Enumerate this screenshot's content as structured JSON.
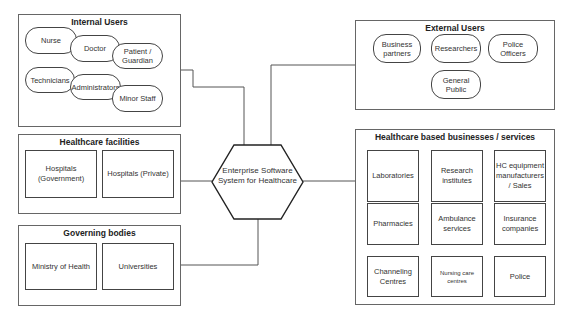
{
  "center": {
    "label_line1": "Enterprise Software",
    "label_line2": "System for Healthcare"
  },
  "internal_users": {
    "title": "Internal Users",
    "items": [
      "Nurse",
      "Doctor",
      "Patient / Guardian",
      "Technicians",
      "Administrators",
      "Minor Staff"
    ]
  },
  "healthcare_facilities": {
    "title": "Healthcare facilities",
    "items": [
      "Hospitals (Government)",
      "Hospitals (Private)"
    ]
  },
  "governing_bodies": {
    "title": "Governing bodies",
    "items": [
      "Ministry of Health",
      "Universities"
    ]
  },
  "external_users": {
    "title": "External Users",
    "items": [
      "Business partners",
      "Researchers",
      "Police Officers",
      "General Public"
    ]
  },
  "healthcare_businesses": {
    "title": "Healthcare based businesses / services",
    "items": [
      "Laboratories",
      "Research institutes",
      "HC equipment manufacturers / Sales",
      "Pharmacies",
      "Ambulance services",
      "Insurance companies",
      "Channeling Centres",
      "Nursing care centres",
      "Police"
    ]
  },
  "colors": {
    "line": "#555555",
    "border": "#444444",
    "background": "#ffffff"
  }
}
